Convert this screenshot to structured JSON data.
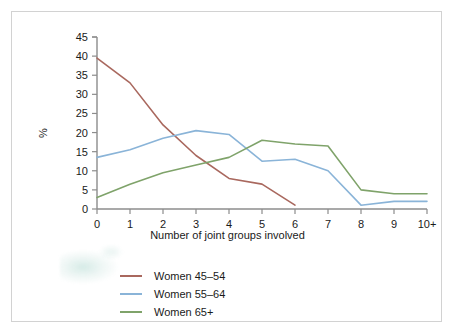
{
  "chart_data": {
    "type": "line",
    "title": "",
    "xlabel": "Number of joint groups involved",
    "ylabel": "%",
    "categories": [
      "0",
      "1",
      "2",
      "3",
      "4",
      "5",
      "6",
      "7",
      "8",
      "9",
      "10+"
    ],
    "xlim": [
      0,
      10
    ],
    "ylim": [
      0,
      45
    ],
    "yticks": [
      "0",
      "5",
      "10",
      "15",
      "20",
      "25",
      "30",
      "35",
      "40",
      "45"
    ],
    "grid": false,
    "legend_position": "bottom-left",
    "series": [
      {
        "name": "Women 45–54",
        "color": "#a9685e",
        "values": [
          39.5,
          33.0,
          22.0,
          14.0,
          8.0,
          6.5,
          1.0,
          null,
          null,
          null,
          null
        ],
        "truncated_after": "6"
      },
      {
        "name": "Women 55–64",
        "color": "#8ab4d8",
        "values": [
          13.5,
          15.5,
          18.5,
          20.5,
          19.5,
          12.5,
          13.0,
          10.0,
          1.0,
          2.0,
          2.0
        ]
      },
      {
        "name": "Women 65+",
        "color": "#7fa36a",
        "values": [
          3.0,
          6.5,
          9.5,
          11.5,
          13.5,
          18.0,
          17.0,
          16.5,
          5.0,
          4.0,
          4.0
        ]
      }
    ]
  },
  "axis": {
    "y_title": "%",
    "x_title": "Number of joint groups involved"
  },
  "legend": {
    "items": [
      {
        "label": "Women 45–54",
        "color": "#a9685e"
      },
      {
        "label": "Women 55–64",
        "color": "#8ab4d8"
      },
      {
        "label": "Women 65+",
        "color": "#7fa36a"
      }
    ]
  }
}
